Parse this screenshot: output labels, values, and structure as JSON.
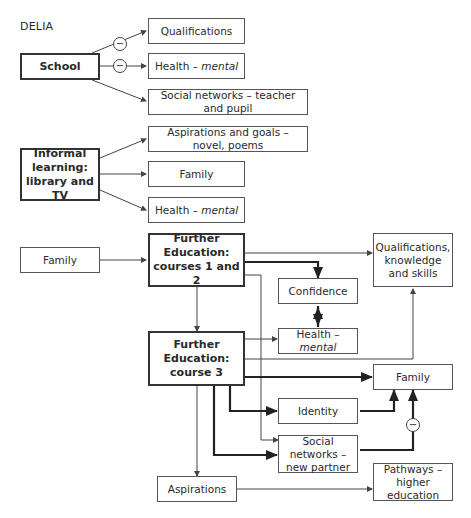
{
  "title": "DELIA",
  "nodes": {
    "school": "School",
    "qualifications": "Qualifications",
    "health_mental_1": {
      "prefix": "Health – ",
      "italic": "mental"
    },
    "social_teacher": "Social networks – teacher and pupil",
    "informal": "Informal learning: library and TV",
    "aspirations_goals": "Aspirations and goals – novel, poems",
    "family_1": "Family",
    "health_mental_2": {
      "prefix": "Health – ",
      "italic": "mental"
    },
    "family_input": "Family",
    "fe12": "Further Education: courses 1 and 2",
    "qual_knowledge": "Qualifications, knowledge and skills",
    "confidence": "Confidence",
    "health_mental_3": {
      "prefix": "Health – ",
      "italic": "mental"
    },
    "fe3": "Further Education: course 3",
    "family_2": "Family",
    "identity": "Identity",
    "social_partner": "Social networks – new partner",
    "aspirations": "Aspirations",
    "pathways": "Pathways – higher education"
  },
  "negative_symbol": "−",
  "colors": {
    "line": "#444444",
    "thick_line": "#222222",
    "border": "#555555"
  }
}
